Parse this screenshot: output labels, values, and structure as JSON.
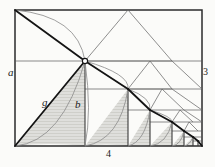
{
  "figure": {
    "colors": {
      "background": "#fbfbf9",
      "frame": "#2b2b2b",
      "thin_line": "#555555",
      "bold_line": "#1a1a1a",
      "curve": "#8a8a8a",
      "shade_fill": "#d8d8d4",
      "label": "#1a1a1a",
      "node_fill": "#ffffff"
    },
    "frame": {
      "x1": 15,
      "y1": 10,
      "x2": 202,
      "y2": 146
    },
    "labels": [
      {
        "key": "a",
        "text": "a",
        "x": 8,
        "y": 67,
        "style": "italic",
        "position": "left-outside"
      },
      {
        "key": "3",
        "text": "3",
        "x": 203,
        "y": 67,
        "style": "normal",
        "position": "right-outside"
      },
      {
        "key": "4",
        "text": "4",
        "x": 106,
        "y": 149,
        "style": "normal",
        "position": "bottom-outside"
      },
      {
        "key": "g",
        "text": "g",
        "x": 42,
        "y": 97,
        "style": "italic",
        "position": "inside-hypotenuse"
      },
      {
        "key": "b",
        "text": "b",
        "x": 75,
        "y": 99,
        "style": "italic",
        "position": "inside-vertical"
      }
    ],
    "vertex_node": {
      "x": 85,
      "y": 61,
      "r": 2.6
    },
    "midline_y": 61,
    "stages": [
      {
        "index": 0,
        "left": 15,
        "right": 85,
        "top": 61,
        "bottom": 146
      },
      {
        "index": 1,
        "left": 85,
        "right": 128,
        "top": 89,
        "bottom": 146
      },
      {
        "index": 2,
        "left": 128,
        "right": 150,
        "top": 110,
        "bottom": 146
      },
      {
        "index": 3,
        "left": 150,
        "right": 172,
        "top": 122,
        "bottom": 146
      },
      {
        "index": 4,
        "left": 172,
        "right": 184,
        "top": 131,
        "bottom": 146
      },
      {
        "index": 5,
        "left": 184,
        "right": 193,
        "top": 137,
        "bottom": 146
      },
      {
        "index": 6,
        "left": 193,
        "right": 198,
        "top": 141,
        "bottom": 146
      },
      {
        "index": 7,
        "left": 198,
        "right": 202,
        "top": 143.5,
        "bottom": 146
      }
    ],
    "horizontal_rules": [
      {
        "y": 61,
        "x1": 15,
        "x2": 202
      },
      {
        "y": 89,
        "x1": 85,
        "x2": 202
      },
      {
        "y": 110,
        "x1": 128,
        "x2": 202
      },
      {
        "y": 122,
        "x1": 150,
        "x2": 202
      },
      {
        "y": 131,
        "x1": 172,
        "x2": 202
      },
      {
        "y": 137,
        "x1": 184,
        "x2": 202
      },
      {
        "y": 141,
        "x1": 193,
        "x2": 202
      }
    ],
    "main_diagonal": {
      "x1": 15,
      "y1": 146,
      "x2": 85,
      "y2": 61
    },
    "upper_diagonal": {
      "x1": 15,
      "y1": 10,
      "x2": 85,
      "y2": 61
    },
    "descending_chain": [
      {
        "x1": 85,
        "y1": 61,
        "x2": 128,
        "y2": 89
      },
      {
        "x1": 128,
        "y1": 89,
        "x2": 150,
        "y2": 110
      },
      {
        "x1": 150,
        "y1": 110,
        "x2": 172,
        "y2": 122
      },
      {
        "x1": 172,
        "y1": 122,
        "x2": 184,
        "y2": 131
      },
      {
        "x1": 184,
        "y1": 131,
        "x2": 193,
        "y2": 137
      },
      {
        "x1": 193,
        "y1": 137,
        "x2": 198,
        "y2": 141
      },
      {
        "x1": 198,
        "y1": 141,
        "x2": 202,
        "y2": 146
      }
    ]
  }
}
